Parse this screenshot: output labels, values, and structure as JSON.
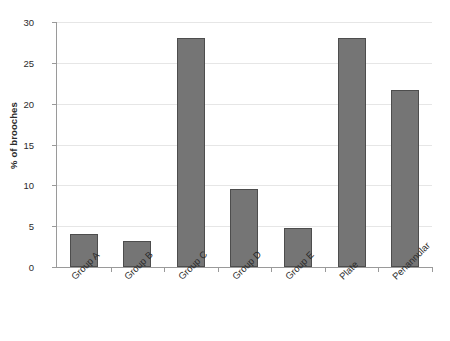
{
  "chart_data": {
    "type": "bar",
    "title": "",
    "xlabel": "",
    "ylabel": "% of brooches",
    "categories": [
      "Group A",
      "Group B",
      "Group C",
      "Group D",
      "Group E",
      "Plate",
      "Penannular"
    ],
    "values": [
      4.0,
      3.2,
      28.1,
      9.6,
      4.8,
      28.1,
      21.7
    ],
    "ylim": [
      0,
      30
    ],
    "yticks": [
      0,
      5,
      10,
      15,
      20,
      25,
      30
    ],
    "ytick_labels": [
      "0",
      "5",
      "10",
      "15",
      "20",
      "25",
      "30"
    ],
    "grid": "horizontal",
    "legend": "none",
    "bar_fill_color": "#757575",
    "bar_border_color": "#4d4d4d",
    "gridline_color": "#e6e6e6",
    "axis_color": "#9a9a9a",
    "text_color": "#2b2b2b",
    "xtick_label_rotation": -45
  }
}
